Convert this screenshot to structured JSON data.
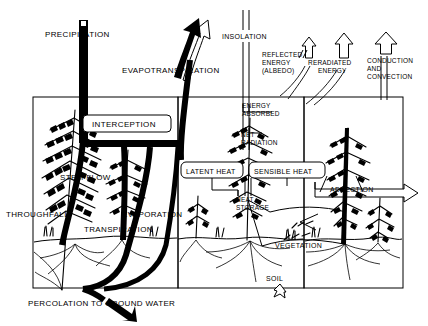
{
  "diagram": {
    "type": "schematic-cycle-diagram",
    "background_color": "#ffffff",
    "line_color": "#000000"
  },
  "water_balance": {
    "panel_name": "water-cycle-panel",
    "labels": {
      "precipitation": "PRECIPITATION",
      "evapotranspiration": "EVAPOTRANSPIRATION",
      "interception": "INTERCEPTION",
      "stem_flow": "STEM FLOW",
      "throughfall": "THROUGHFALL",
      "evaporation": "EVAPORATION",
      "transpiration": "TRANSPIRATION",
      "percolation": "PERCOLATION TO GROUND WATER"
    }
  },
  "energy_balance": {
    "panel_name": "energy-balance-panel",
    "labels": {
      "insolation": "INSOLATION",
      "reflected_energy": "REFLECTED",
      "reflected_energy_2": "ENERGY",
      "reflected_energy_3": "(ALBEDO)",
      "reradiated_energy": "RERADIATED",
      "reradiated_energy_2": "ENERGY",
      "conduction": "CONDUCTION",
      "conduction_2": "AND",
      "conduction_3": "CONVECTION",
      "energy_absorbed": "ENERGY",
      "energy_absorbed_2": "ABSORBED",
      "net_radiation": "NET",
      "net_radiation_2": "RADIATION",
      "latent_heat": "LATENT HEAT",
      "sensible_heat": "SENSIBLE HEAT",
      "advection": "ADVECTION",
      "heat_storage": "HEAT",
      "heat_storage_2": "STORAGE",
      "vegetation": "VEGETATION",
      "soil": "SOIL"
    }
  },
  "colors": {
    "ink": "#000000",
    "paper": "#ffffff"
  }
}
